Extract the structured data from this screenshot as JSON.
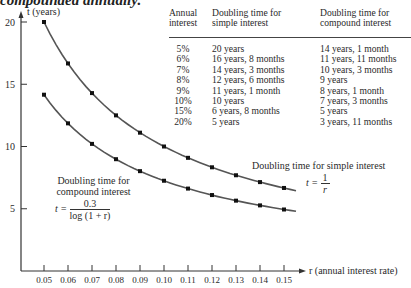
{
  "header_fragment": "compounded annually.",
  "table": {
    "columns": [
      "Annual interest",
      "Doubling time for simple interest",
      "Doubling time for compound interest"
    ],
    "column_lines": [
      [
        "Annual",
        "interest"
      ],
      [
        "Doubling time for",
        "simple interest"
      ],
      [
        "Doubling time for",
        "compound interest"
      ]
    ],
    "rows": [
      [
        "5%",
        "20 years",
        "14 years, 1 month"
      ],
      [
        "6%",
        "16 years, 8 months",
        "11 years, 11 months"
      ],
      [
        "7%",
        "14 years, 3 months",
        "10 years, 3 months"
      ],
      [
        "8%",
        "12 years, 6 months",
        "9 years"
      ],
      [
        "9%",
        "11 years, 1 month",
        "8 years, 1 month"
      ],
      [
        "10%",
        "10 years",
        "7 years, 3 months"
      ],
      [
        "15%",
        "6 years, 8 months",
        "5 years"
      ],
      [
        "20%",
        "5 years",
        "3 years, 11 months"
      ]
    ]
  },
  "annotations": {
    "compound": {
      "line1": "Doubling time for",
      "line2": "compound interest",
      "eq_lhs": "t =",
      "eq_num": "0.3",
      "eq_den": "log (1 + r)"
    },
    "simple": {
      "line1": "Doubling time for simple interest",
      "eq_lhs": "t =",
      "eq_num": "1",
      "eq_den": "r"
    }
  },
  "chart_data": {
    "type": "line",
    "title": "",
    "xlabel": "r (annual interest rate)",
    "ylabel": "t (years)",
    "x": [
      0.05,
      0.06,
      0.07,
      0.08,
      0.09,
      0.1,
      0.11,
      0.12,
      0.13,
      0.14,
      0.15
    ],
    "x_tick_labels": [
      "0.05",
      "0.06",
      "0.07",
      "0.08",
      "0.09",
      "0.10",
      "0.11",
      "0.12",
      "0.13",
      "0.14",
      "0.15"
    ],
    "y_ticks": [
      5,
      10,
      15,
      20
    ],
    "y_tick_labels": [
      "5",
      "10",
      "15",
      "20"
    ],
    "ylim": [
      0,
      21
    ],
    "xlim": [
      0.04,
      0.165
    ],
    "grid": false,
    "series": [
      {
        "name": "Doubling time for simple interest, t = 1/r",
        "values": [
          20.0,
          16.67,
          14.29,
          12.5,
          11.11,
          10.0,
          9.09,
          8.33,
          7.69,
          7.14,
          6.67
        ]
      },
      {
        "name": "Doubling time for compound interest, t = 0.3/log(1 + r)",
        "values": [
          14.16,
          11.86,
          10.21,
          8.98,
          8.02,
          7.25,
          6.62,
          6.1,
          5.65,
          5.27,
          4.94
        ]
      }
    ],
    "style": {
      "line_color": "#555555",
      "point_color": "#111111",
      "axis_color": "#333333"
    }
  }
}
